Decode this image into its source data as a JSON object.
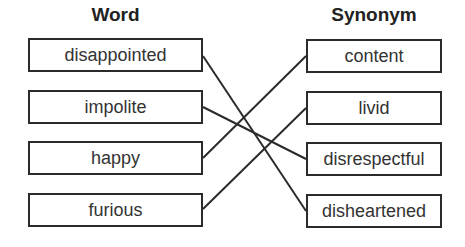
{
  "headers": {
    "left": "Word",
    "right": "Synonym"
  },
  "words": [
    "disappointed",
    "impolite",
    "happy",
    "furious"
  ],
  "synonyms": [
    "content",
    "livid",
    "disrespectful",
    "disheartened"
  ],
  "matches": [
    {
      "word": "disappointed",
      "synonym": "disheartened"
    },
    {
      "word": "impolite",
      "synonym": "disrespectful"
    },
    {
      "word": "happy",
      "synonym": "content"
    },
    {
      "word": "furious",
      "synonym": "livid"
    }
  ]
}
